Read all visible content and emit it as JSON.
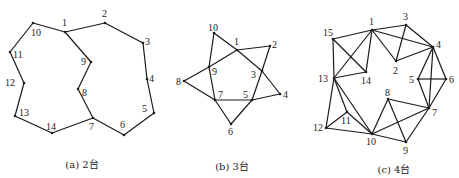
{
  "figure": {
    "panels": [
      {
        "id": "a",
        "caption": "(a) 2台",
        "caption_pos": [
          82,
          156
        ],
        "nodes": [
          {
            "id": "1",
            "x": 65,
            "y": 32,
            "lx": 62,
            "ly": 26
          },
          {
            "id": "2",
            "x": 105,
            "y": 23,
            "lx": 102,
            "ly": 17
          },
          {
            "id": "3",
            "x": 143,
            "y": 43,
            "lx": 145,
            "ly": 45
          },
          {
            "id": "4",
            "x": 147,
            "y": 79,
            "lx": 149,
            "ly": 82
          },
          {
            "id": "5",
            "x": 154,
            "y": 113,
            "lx": 142,
            "ly": 112
          },
          {
            "id": "6",
            "x": 124,
            "y": 135,
            "lx": 120,
            "ly": 128
          },
          {
            "id": "7",
            "x": 93,
            "y": 118,
            "lx": 89,
            "ly": 130
          },
          {
            "id": "8",
            "x": 78,
            "y": 89,
            "lx": 82,
            "ly": 96
          },
          {
            "id": "9",
            "x": 91,
            "y": 62,
            "lx": 81,
            "ly": 65
          },
          {
            "id": "10",
            "x": 33,
            "y": 23,
            "lx": 31,
            "ly": 36
          },
          {
            "id": "11",
            "x": 10,
            "y": 52,
            "lx": 13,
            "ly": 58
          },
          {
            "id": "12",
            "x": 24,
            "y": 83,
            "lx": 5,
            "ly": 86
          },
          {
            "id": "13",
            "x": 15,
            "y": 116,
            "lx": 19,
            "ly": 116
          },
          {
            "id": "14",
            "x": 52,
            "y": 133,
            "lx": 46,
            "ly": 130
          }
        ],
        "edges": [
          [
            "1",
            "2"
          ],
          [
            "2",
            "3"
          ],
          [
            "3",
            "4"
          ],
          [
            "4",
            "5"
          ],
          [
            "5",
            "6"
          ],
          [
            "6",
            "7"
          ],
          [
            "7",
            "14"
          ],
          [
            "14",
            "13"
          ],
          [
            "13",
            "12"
          ],
          [
            "12",
            "11"
          ],
          [
            "11",
            "10"
          ],
          [
            "10",
            "1"
          ],
          [
            "1",
            "9"
          ],
          [
            "9",
            "8"
          ],
          [
            "8",
            "7"
          ]
        ]
      },
      {
        "id": "b",
        "caption": "(b) 3台",
        "caption_pos": [
          232,
          158
        ],
        "nodes": [
          {
            "id": "1",
            "x": 237,
            "y": 50,
            "lx": 234,
            "ly": 45
          },
          {
            "id": "2",
            "x": 270,
            "y": 46,
            "lx": 272,
            "ly": 48
          },
          {
            "id": "3",
            "x": 262,
            "y": 71,
            "lx": 251,
            "ly": 78
          },
          {
            "id": "4",
            "x": 280,
            "y": 94,
            "lx": 283,
            "ly": 98
          },
          {
            "id": "5",
            "x": 252,
            "y": 100,
            "lx": 243,
            "ly": 98
          },
          {
            "id": "6",
            "x": 231,
            "y": 124,
            "lx": 228,
            "ly": 135
          },
          {
            "id": "7",
            "x": 215,
            "y": 100,
            "lx": 218,
            "ly": 98
          },
          {
            "id": "8",
            "x": 184,
            "y": 81,
            "lx": 176,
            "ly": 85
          },
          {
            "id": "9",
            "x": 209,
            "y": 67,
            "lx": 212,
            "ly": 75
          },
          {
            "id": "10",
            "x": 214,
            "y": 33,
            "lx": 208,
            "ly": 31
          }
        ],
        "edges": [
          [
            "10",
            "1"
          ],
          [
            "1",
            "3"
          ],
          [
            "3",
            "4"
          ],
          [
            "8",
            "9"
          ],
          [
            "9",
            "1"
          ],
          [
            "1",
            "2"
          ],
          [
            "2",
            "3"
          ],
          [
            "3",
            "5"
          ],
          [
            "5",
            "6"
          ],
          [
            "8",
            "7"
          ],
          [
            "7",
            "5"
          ],
          [
            "5",
            "4"
          ],
          [
            "6",
            "7"
          ],
          [
            "7",
            "9"
          ],
          [
            "9",
            "10"
          ]
        ]
      },
      {
        "id": "c",
        "caption": "(c) 4台",
        "caption_pos": [
          394,
          161
        ],
        "nodes": [
          {
            "id": "1",
            "x": 372,
            "y": 30,
            "lx": 369,
            "ly": 25
          },
          {
            "id": "2",
            "x": 396,
            "y": 61,
            "lx": 393,
            "ly": 74
          },
          {
            "id": "3",
            "x": 406,
            "y": 25,
            "lx": 403,
            "ly": 20
          },
          {
            "id": "4",
            "x": 433,
            "y": 47,
            "lx": 436,
            "ly": 48
          },
          {
            "id": "5",
            "x": 418,
            "y": 79,
            "lx": 409,
            "ly": 83
          },
          {
            "id": "6",
            "x": 446,
            "y": 79,
            "lx": 449,
            "ly": 83
          },
          {
            "id": "7",
            "x": 429,
            "y": 108,
            "lx": 432,
            "ly": 116
          },
          {
            "id": "8",
            "x": 388,
            "y": 99,
            "lx": 385,
            "ly": 96
          },
          {
            "id": "9",
            "x": 406,
            "y": 142,
            "lx": 403,
            "ly": 154
          },
          {
            "id": "10",
            "x": 372,
            "y": 134,
            "lx": 366,
            "ly": 145
          },
          {
            "id": "11",
            "x": 347,
            "y": 112,
            "lx": 341,
            "ly": 124
          },
          {
            "id": "12",
            "x": 326,
            "y": 128,
            "lx": 313,
            "ly": 131
          },
          {
            "id": "13",
            "x": 334,
            "y": 78,
            "lx": 318,
            "ly": 82
          },
          {
            "id": "14",
            "x": 366,
            "y": 72,
            "lx": 361,
            "ly": 84
          },
          {
            "id": "15",
            "x": 333,
            "y": 39,
            "lx": 323,
            "ly": 36
          }
        ],
        "edges": [
          [
            "1",
            "15"
          ],
          [
            "1",
            "14"
          ],
          [
            "1",
            "13"
          ],
          [
            "1",
            "3"
          ],
          [
            "1",
            "4"
          ],
          [
            "1",
            "2"
          ],
          [
            "15",
            "13"
          ],
          [
            "15",
            "14"
          ],
          [
            "13",
            "14"
          ],
          [
            "3",
            "2"
          ],
          [
            "3",
            "4"
          ],
          [
            "2",
            "4"
          ],
          [
            "4",
            "5"
          ],
          [
            "4",
            "6"
          ],
          [
            "4",
            "7"
          ],
          [
            "5",
            "6"
          ],
          [
            "5",
            "7"
          ],
          [
            "6",
            "7"
          ],
          [
            "7",
            "8"
          ],
          [
            "7",
            "10"
          ],
          [
            "7",
            "9"
          ],
          [
            "8",
            "10"
          ],
          [
            "8",
            "9"
          ],
          [
            "9",
            "10"
          ],
          [
            "10",
            "13"
          ],
          [
            "10",
            "11"
          ],
          [
            "10",
            "12"
          ],
          [
            "11",
            "13"
          ],
          [
            "11",
            "12"
          ],
          [
            "12",
            "13"
          ]
        ]
      }
    ],
    "colors": {
      "line": "#1a1a1a",
      "text": "#222222",
      "background": "#ffffff"
    }
  }
}
